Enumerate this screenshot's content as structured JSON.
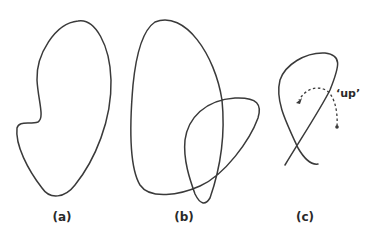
{
  "figure": {
    "panels": [
      {
        "id": "a",
        "label": "(a)",
        "description": "simple closed curve (kidney shape)"
      },
      {
        "id": "b",
        "label": "(b)",
        "description": "closed curve with self-crossings"
      },
      {
        "id": "c",
        "label": "(c)",
        "description": "curve segment with crossing and 'up' direction arrow"
      }
    ],
    "annotation": "‘up’",
    "colors": {
      "stroke": "#3a3a3a",
      "background": "#ffffff"
    }
  }
}
